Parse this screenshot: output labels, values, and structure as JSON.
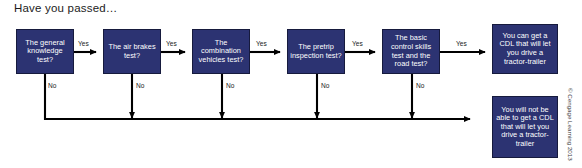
{
  "title": "Have you passed…",
  "copyright": "© Cengage Learning 2013",
  "colors": {
    "node_fill": "#2c3372",
    "node_border": "#161a3d",
    "node_text": "#ffffff",
    "wire": "#000000",
    "page_background": "#ffffff",
    "label_text": "#1b1b1b"
  },
  "nodes": [
    {
      "id": "general-knowledge-test",
      "label": "The general knowledge test?",
      "x": 16,
      "y": 29,
      "w": 58,
      "h": 45
    },
    {
      "id": "air-brakes-test",
      "label": "The air brakes test?",
      "x": 103,
      "y": 29,
      "w": 58,
      "h": 45
    },
    {
      "id": "combination-vehicles-test",
      "label": "The combination vehicles test?",
      "x": 192,
      "y": 29,
      "w": 58,
      "h": 45
    },
    {
      "id": "pretrip-inspection-test",
      "label": "The pretrip inspection test?",
      "x": 287,
      "y": 29,
      "w": 58,
      "h": 45
    },
    {
      "id": "basic-control-road-test",
      "label": "The basic control skills test and the road test?",
      "x": 382,
      "y": 29,
      "w": 58,
      "h": 45
    },
    {
      "id": "outcome-pass",
      "label": "You can get a CDL that will let you drive a tractor-trailer",
      "x": 492,
      "y": 24,
      "w": 66,
      "h": 50
    },
    {
      "id": "outcome-fail",
      "label": "You will not be able to get a CDL that will let you drive a tractor-trailer",
      "x": 492,
      "y": 96,
      "w": 66,
      "h": 62
    }
  ],
  "yes_labels": [
    {
      "text": "Yes",
      "x": 78,
      "y": 40
    },
    {
      "text": "Yes",
      "x": 166,
      "y": 40
    },
    {
      "text": "Yes",
      "x": 256,
      "y": 40
    },
    {
      "text": "Yes",
      "x": 352,
      "y": 40
    },
    {
      "text": "Yes",
      "x": 456,
      "y": 40
    }
  ],
  "no_labels": [
    {
      "text": "No",
      "x": 48,
      "y": 89
    },
    {
      "text": "No",
      "x": 136,
      "y": 89
    },
    {
      "text": "No",
      "x": 226,
      "y": 89
    },
    {
      "text": "No",
      "x": 321,
      "y": 89
    },
    {
      "text": "No",
      "x": 416,
      "y": 89
    }
  ]
}
